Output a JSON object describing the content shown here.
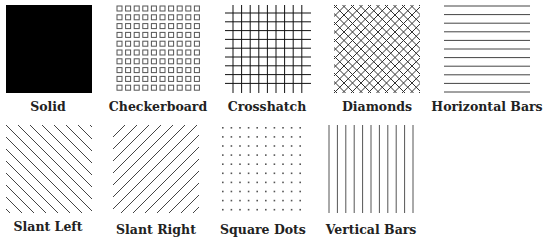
{
  "patterns": [
    {
      "name": "Solid"
    },
    {
      "name": "Checkerboard"
    },
    {
      "name": "Crosshatch"
    },
    {
      "name": "Diamonds"
    },
    {
      "name": "Horizontal Bars"
    },
    {
      "name": "Slant Left"
    },
    {
      "name": "Slant Right"
    },
    {
      "name": "Square Dots"
    },
    {
      "name": "Vertical Bars"
    }
  ],
  "colors": {
    "stroke": "#000000",
    "background": "#ffffff"
  }
}
